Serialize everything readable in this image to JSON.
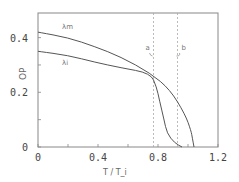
{
  "chart_data": {
    "type": "line",
    "title": "",
    "xlabel": "T / T_i",
    "ylabel": "OP",
    "xlim": [
      0,
      1.2
    ],
    "ylim": [
      0,
      0.49
    ],
    "xticks": [
      0,
      0.2,
      0.4,
      0.6,
      0.8,
      1.0,
      1.2
    ],
    "xtick_labels": [
      "0",
      "0.4",
      "0.8",
      "1.2"
    ],
    "xtick_label_values": [
      0,
      0.4,
      0.8,
      1.2
    ],
    "yticks": [
      0,
      0.1,
      0.2,
      0.3,
      0.4
    ],
    "ytick_labels": [
      "0",
      "0.2",
      "0.4"
    ],
    "ytick_label_values": [
      0,
      0.2,
      0.4
    ],
    "grid": false,
    "legend": null,
    "series": [
      {
        "name": "λm",
        "label_pos": [
          0.16,
          0.43
        ],
        "x": [
          0,
          0.2,
          0.38,
          0.55,
          0.75,
          0.88,
          0.98,
          1.02,
          1.03,
          1.04
        ],
        "y": [
          0.42,
          0.4,
          0.367,
          0.33,
          0.27,
          0.21,
          0.12,
          0.06,
          0.03,
          0.0
        ]
      },
      {
        "name": "λi",
        "label_pos": [
          0.16,
          0.3
        ],
        "x": [
          0,
          0.2,
          0.38,
          0.55,
          0.75,
          0.79,
          0.81,
          0.84,
          0.86,
          0.91,
          0.96
        ],
        "y": [
          0.35,
          0.335,
          0.31,
          0.29,
          0.27,
          0.22,
          0.17,
          0.1,
          0.05,
          0.015,
          0.0
        ]
      }
    ],
    "vlines": [
      {
        "label": "a",
        "x": 0.77,
        "style": "dashed"
      },
      {
        "label": "b",
        "x": 0.93,
        "style": "dashed"
      }
    ]
  }
}
